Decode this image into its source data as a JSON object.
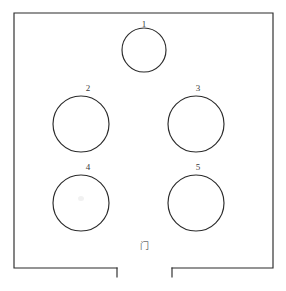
{
  "diagram": {
    "kind": "room-layout-floorplan",
    "canvas": {
      "width": 286,
      "height": 291,
      "background": "#ffffff"
    },
    "line_color": "#2b2b2b",
    "label_color": "#3a3a3a",
    "door_mark_color": "#6d6d6d"
  },
  "room": {
    "name": "room-outline",
    "left": 14,
    "top": 13,
    "right": 273,
    "bottom": 268,
    "doorway": {
      "name": "bottom-doorway-gap",
      "gap_left": 117,
      "gap_right": 172,
      "jamb_depth": 9,
      "mark": "门"
    }
  },
  "tables": [
    {
      "label": "1",
      "cx": 144,
      "cy": 50,
      "r": 22,
      "label_x": 144,
      "label_y": 20
    },
    {
      "label": "2",
      "cx": 81,
      "cy": 124,
      "r": 28,
      "label_x": 88,
      "label_y": 84
    },
    {
      "label": "3",
      "cx": 196,
      "cy": 124,
      "r": 28,
      "label_x": 198,
      "label_y": 84
    },
    {
      "label": "4",
      "cx": 81,
      "cy": 203,
      "r": 28,
      "label_x": 88,
      "label_y": 163
    },
    {
      "label": "5",
      "cx": 196,
      "cy": 203,
      "r": 28,
      "label_x": 198,
      "label_y": 163
    }
  ]
}
